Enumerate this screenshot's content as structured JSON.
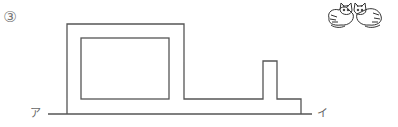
{
  "problem": {
    "number": "3",
    "number_glyph": "③"
  },
  "labels": {
    "start": "ア",
    "end": "イ"
  },
  "figure": {
    "stroke_color": "#555555",
    "baseline": {
      "x1": 48,
      "x2": 312,
      "y": 114
    },
    "outer_path": "M67,114 L67,24 L184,24 L184,99 L263,99 L263,61 L277,61 L277,99 L301,99 L301,114",
    "inner_rect": {
      "x": 81,
      "y": 38,
      "w": 88,
      "h": 61
    }
  },
  "decoration": {
    "icon": "two-cats-illustration"
  }
}
